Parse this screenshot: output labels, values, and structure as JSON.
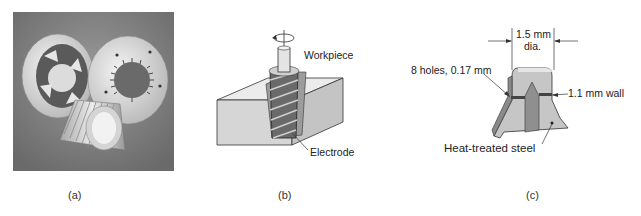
{
  "panels": [
    {
      "id": "a",
      "caption": "(a)",
      "description": "Photograph of extruded/EDM-machined metal parts: two discs with starburst cutouts and a finned cylinder"
    },
    {
      "id": "b",
      "caption": "(b)",
      "labels": {
        "workpiece": "Workpiece",
        "electrode": "Electrode"
      },
      "icons": [
        "rotation-arrow-icon"
      ]
    },
    {
      "id": "c",
      "caption": "(c)",
      "labels": {
        "diameter_value": "1.5 mm",
        "diameter_unit": "dia.",
        "holes": "8 holes, 0.17 mm",
        "wall": "1.1 mm wall",
        "material": "Heat-treated steel"
      }
    }
  ],
  "colors": {
    "photo_bg": "#7a7a7a",
    "part_light": "#e0e0e0",
    "block_face": "#d8d8d8",
    "electrode_dark": "#555555",
    "steel_gray": "#bdbdbd"
  }
}
